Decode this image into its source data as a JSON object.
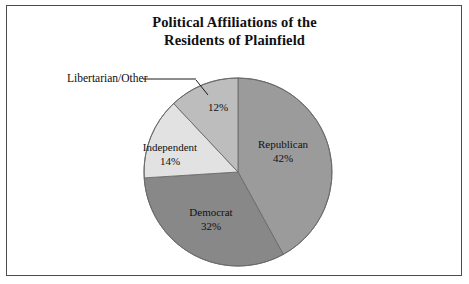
{
  "figure": {
    "title_line1": "Political Affiliations of the",
    "title_line2": "Residents of Plainfield",
    "background": "#ffffff",
    "border_color": "#4c4c4c"
  },
  "chart_data": {
    "type": "pie",
    "title": "Political Affiliations of the Residents of Plainfield",
    "xlabel": "",
    "ylabel": "",
    "categories": [
      "Republican",
      "Democrat",
      "Independent",
      "Libertarian/Other"
    ],
    "values": [
      42,
      32,
      14,
      12
    ],
    "value_unit": "percent",
    "start_angle_deg": 0,
    "direction": "clockwise",
    "legend": "none",
    "grid": false,
    "slices": [
      {
        "label": "Republican",
        "percent_text": "42%",
        "value": 42,
        "color": "#9b9b9b",
        "label_placement": "inside"
      },
      {
        "label": "Democrat",
        "percent_text": "32%",
        "value": 32,
        "color": "#888888",
        "label_placement": "inside"
      },
      {
        "label": "Independent",
        "percent_text": "14%",
        "value": 14,
        "color": "#e2e2e2",
        "label_placement": "outside-left"
      },
      {
        "label": "Libertarian/Other",
        "percent_text": "12%",
        "value": 12,
        "color": "#bdbdbd",
        "label_placement": "callout"
      }
    ]
  },
  "geometry": {
    "center_x": 238,
    "center_y": 172,
    "radius": 94,
    "outline_color": "#6b6b6b"
  }
}
